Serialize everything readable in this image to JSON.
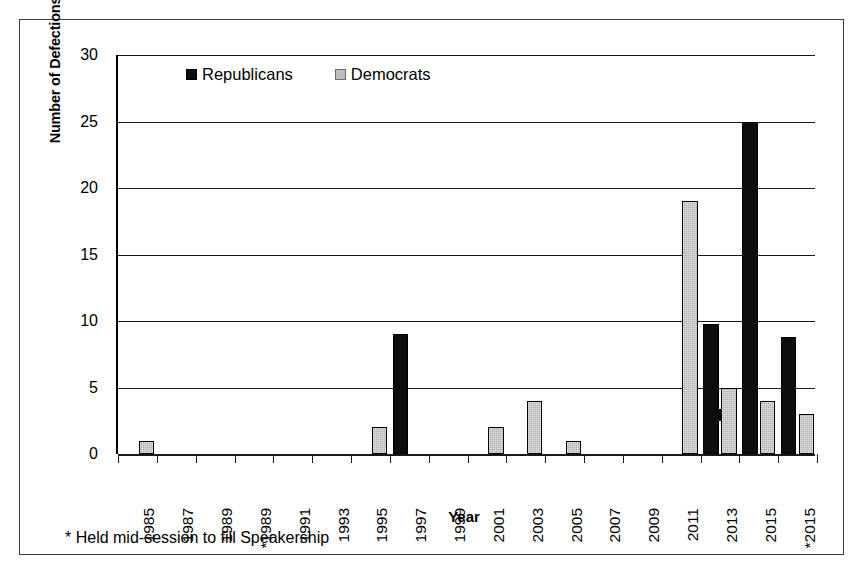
{
  "chart_data": {
    "type": "bar",
    "title": "",
    "xlabel": "Year",
    "ylabel": "Number of Defections",
    "ylim": [
      0,
      30
    ],
    "yticks": [
      0,
      5,
      10,
      15,
      20,
      25,
      30
    ],
    "grid": true,
    "legend_position": "top-inside-left",
    "categories": [
      "1985",
      "1987",
      "1989",
      "*1989",
      "1991",
      "1993",
      "1995",
      "1997",
      "1999",
      "2001",
      "2003",
      "2005",
      "2007",
      "2009",
      "2011",
      "2013",
      "2015",
      "*2015"
    ],
    "series": [
      {
        "name": "Republicans",
        "color": "#0d0d0d",
        "values": [
          0,
          0,
          0,
          0,
          0,
          0,
          0,
          9,
          0,
          0,
          0,
          0,
          0,
          0,
          0,
          9.8,
          25,
          8.8
        ]
      },
      {
        "name": "Democrats",
        "color": "#b3b3b3",
        "values": [
          1,
          0,
          0,
          0,
          0,
          0,
          2,
          0,
          0,
          2,
          4,
          1,
          0,
          0,
          19,
          5,
          4,
          3
        ]
      }
    ],
    "annotations": [
      "* Held mid-session to fill Speakership"
    ]
  },
  "legend": {
    "items": [
      {
        "label": "Republicans",
        "swatch": "black-square-icon"
      },
      {
        "label": "Democrats",
        "swatch": "gray-square-icon"
      }
    ]
  },
  "axes": {
    "y_title": "Number of Defections",
    "x_title": "Year"
  },
  "footnote": "* Held mid-session to fill Speakership",
  "colors": {
    "republicans": "#0d0d0d",
    "democrats": "#b3b3b3",
    "axis": "#1a1a1a",
    "frame": "#3a3a3a",
    "background": "#ffffff"
  }
}
